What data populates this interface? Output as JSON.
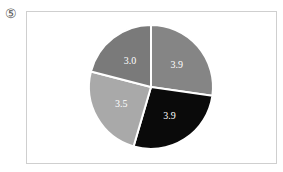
{
  "figure_number": "⑤",
  "chart_data": {
    "type": "pie",
    "title": "",
    "start_angle": "12 o'clock",
    "direction": "clockwise",
    "slices": [
      {
        "label": "3.9",
        "value": 3.9,
        "color": "#858585"
      },
      {
        "label": "3.9",
        "value": 3.9,
        "color": "#0a0a0a"
      },
      {
        "label": "3.5",
        "value": 3.5,
        "color": "#a9a9a9"
      },
      {
        "label": "3.0",
        "value": 3.0,
        "color": "#7a7a7a"
      }
    ],
    "values": [
      3.9,
      3.9,
      3.5,
      3.0
    ],
    "legend": "none",
    "data_labels": true
  }
}
